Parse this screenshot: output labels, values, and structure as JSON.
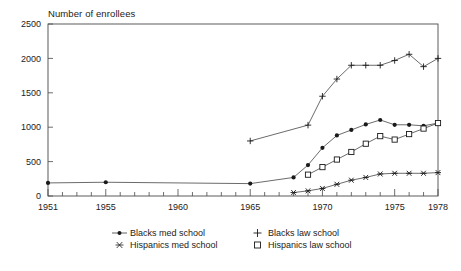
{
  "chart_data": {
    "type": "line",
    "title": "Number of enrollees",
    "xlabel": "",
    "ylabel": "Number of enrollees",
    "xlim": [
      1951,
      1978
    ],
    "ylim": [
      0,
      2500
    ],
    "yticks": [
      0,
      500,
      1000,
      1500,
      2000,
      2500
    ],
    "ytick_labels": [
      "0",
      "500",
      "1000",
      "1500",
      "2000",
      "2500"
    ],
    "xticks": [
      1951,
      1955,
      1960,
      1965,
      1970,
      1975,
      1978
    ],
    "xtick_labels": [
      "1951",
      "1955",
      "1960",
      "1965",
      "1970",
      "1975",
      "1978"
    ],
    "xtick_minor_step": 1,
    "grid": false,
    "legend_position": "below-center",
    "series": [
      {
        "name": "Blacks med school",
        "marker": "filled-circle",
        "x": [
          1951,
          1955,
          1965,
          1968,
          1969,
          1970,
          1971,
          1972,
          1973,
          1974,
          1975,
          1976,
          1977,
          1978
        ],
        "values": [
          190,
          200,
          180,
          270,
          450,
          700,
          880,
          960,
          1040,
          1105,
          1035,
          1035,
          1020,
          1060
        ]
      },
      {
        "name": "Blacks law school",
        "marker": "plus",
        "x": [
          1965,
          1969,
          1970,
          1971,
          1972,
          1973,
          1974,
          1975,
          1976,
          1977,
          1978
        ],
        "values": [
          800,
          1030,
          1450,
          1700,
          1900,
          1900,
          1900,
          1970,
          2060,
          1880,
          2000
        ]
      },
      {
        "name": "Hispanics med school",
        "marker": "star",
        "x": [
          1968,
          1969,
          1970,
          1971,
          1972,
          1973,
          1974,
          1975,
          1976,
          1977,
          1978
        ],
        "values": [
          50,
          75,
          110,
          170,
          230,
          270,
          320,
          330,
          330,
          330,
          340
        ]
      },
      {
        "name": "Hispanics law school",
        "marker": "open-square",
        "x": [
          1969,
          1970,
          1971,
          1972,
          1973,
          1974,
          1975,
          1976,
          1977,
          1978
        ],
        "values": [
          310,
          420,
          530,
          640,
          760,
          870,
          820,
          900,
          980,
          1060
        ]
      }
    ]
  },
  "legend": {
    "entries": [
      {
        "label": "Blacks med school",
        "marker": "filled-circle"
      },
      {
        "label": "Blacks law school",
        "marker": "plus"
      },
      {
        "label": "Hispanics med school",
        "marker": "star"
      },
      {
        "label": "Hispanics law school",
        "marker": "open-square"
      }
    ]
  }
}
